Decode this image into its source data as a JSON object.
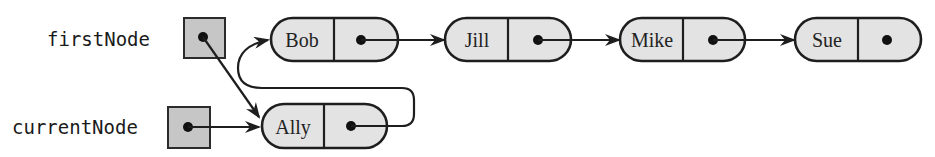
{
  "diagram": {
    "type": "linked-list",
    "colors": {
      "pointer_box_fill": "#c6c6c6",
      "node_fill": "#e3e3e3",
      "stroke": "#1e1e1e"
    },
    "references": [
      {
        "id": "firstNode",
        "label": "firstNode",
        "points_to": "Ally"
      },
      {
        "id": "currentNode",
        "label": "currentNode",
        "points_to": "Ally"
      }
    ],
    "nodes": [
      {
        "id": "Ally",
        "data": "Ally",
        "next": "Bob"
      },
      {
        "id": "Bob",
        "data": "Bob",
        "next": "Jill"
      },
      {
        "id": "Jill",
        "data": "Jill",
        "next": "Mike"
      },
      {
        "id": "Mike",
        "data": "Mike",
        "next": "Sue"
      },
      {
        "id": "Sue",
        "data": "Sue",
        "next": null
      }
    ],
    "labels": {
      "first_node": "firstNode",
      "current_node": "currentNode",
      "node_bob": "Bob",
      "node_jill": "Jill",
      "node_mike": "Mike",
      "node_sue": "Sue",
      "node_ally": "Ally"
    }
  }
}
